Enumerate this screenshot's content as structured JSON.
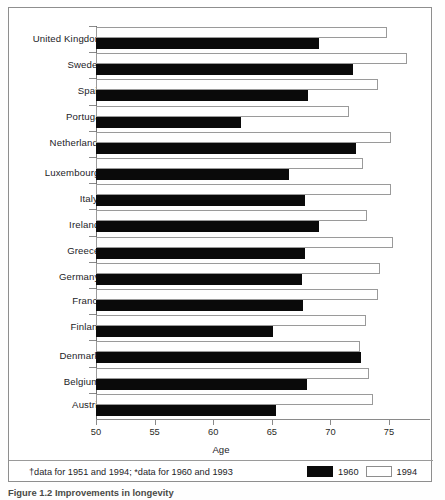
{
  "figure": {
    "caption": "Figure 1.2  Improvements in longevity",
    "axis_title": "Age",
    "footnote": "†data for 1951 and 1994; *data for 1960 and 1993"
  },
  "legend": {
    "position": "bottom-right",
    "items": [
      {
        "label": "1960",
        "swatch": "dark",
        "color": "#0a0a0a"
      },
      {
        "label": "1994",
        "swatch": "light",
        "color": "#ffffff"
      }
    ]
  },
  "axis": {
    "ticks": [
      50,
      55,
      60,
      65,
      70,
      75
    ],
    "min": 50,
    "max": 77.5,
    "label": "Age"
  },
  "chart_data": {
    "type": "bar",
    "orientation": "horizontal",
    "title": "Improvements in longevity",
    "xlabel": "Age",
    "ylabel": "",
    "xlim": [
      50,
      77.5
    ],
    "grid": false,
    "legend_position": "bottom-right",
    "categories": [
      "United Kingdom",
      "Sweden",
      "Spain",
      "Portugal",
      "Netherlands",
      "Luxembourg*",
      "Italy†",
      "Ireland*",
      "Greece*",
      "Germany*",
      "France",
      "Finland",
      "Denmark*",
      "Belgium*",
      "Austria"
    ],
    "series": [
      {
        "name": "1960",
        "color": "#0a0a0a",
        "values": [
          69.0,
          71.9,
          68.1,
          62.4,
          72.2,
          66.5,
          67.8,
          69.0,
          67.8,
          67.6,
          67.7,
          65.1,
          72.6,
          68.0,
          65.4
        ]
      },
      {
        "name": "1994",
        "color": "#ffffff",
        "values": [
          74.8,
          76.5,
          74.1,
          71.6,
          75.2,
          72.8,
          75.2,
          73.1,
          75.3,
          74.2,
          74.1,
          73.0,
          72.5,
          73.3,
          73.6
        ]
      }
    ],
    "annotations": [
      "†data for 1951 and 1994; *data for 1960 and 1993"
    ]
  }
}
